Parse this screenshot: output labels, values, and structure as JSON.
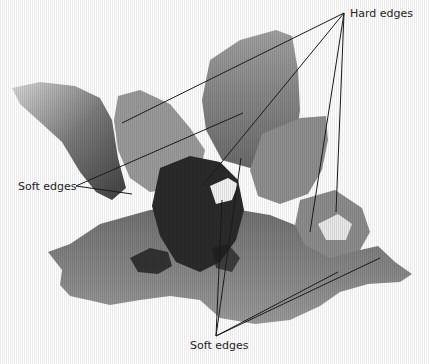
{
  "figure": {
    "annotations": [
      {
        "id": "hard",
        "text": "Hard edges"
      },
      {
        "id": "soft-left",
        "text": "Soft edges"
      },
      {
        "id": "soft-bottom",
        "text": "Soft edges"
      }
    ]
  },
  "colors": {
    "background": "#ffffff",
    "leader_line": "#1a1a1a",
    "label_text": "#222222"
  }
}
